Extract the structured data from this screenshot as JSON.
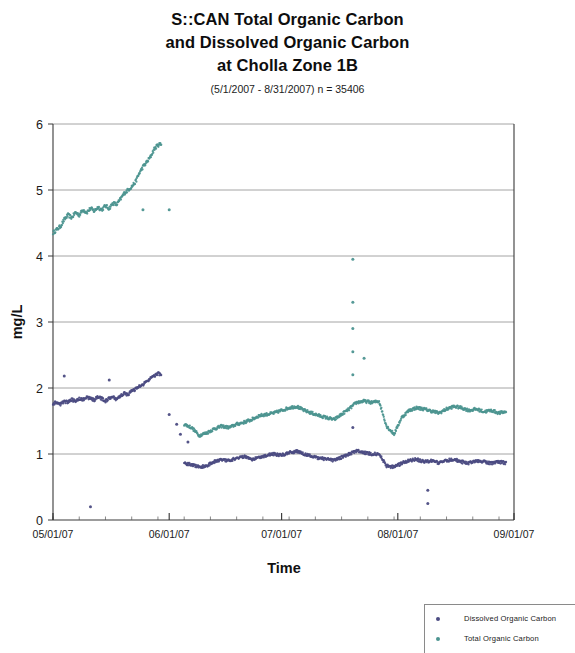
{
  "title": {
    "line1": "S::CAN Total Organic Carbon",
    "line2": "and Dissolved Organic Carbon",
    "line3": "at Cholla Zone 1B",
    "subtitle": "(5/1/2007 - 8/31/2007) n = 35406"
  },
  "legend": {
    "items": [
      {
        "label": "Dissolved Organic Carbon",
        "color": "#4b4b82"
      },
      {
        "label": "Total Organic Carbon",
        "color": "#4c9490"
      }
    ]
  },
  "chart_data": {
    "type": "scatter",
    "title": "S::CAN Total Organic Carbon and Dissolved Organic Carbon at Cholla Zone 1B",
    "subtitle": "(5/1/2007 - 8/31/2007) n = 35406",
    "xlabel": "Time",
    "ylabel": "mg/L",
    "xlim": [
      "05/01/07",
      "09/01/07"
    ],
    "ylim": [
      0,
      6
    ],
    "yticks": [
      0,
      1,
      2,
      3,
      4,
      5,
      6
    ],
    "xticks": [
      "05/01/07",
      "06/01/07",
      "07/01/07",
      "08/01/07",
      "09/01/07"
    ],
    "xtick_minor_interval_days": 7,
    "grid": "horizontal",
    "legend_position": "bottom-right",
    "n_points": 35406,
    "series": [
      {
        "name": "Total Organic Carbon",
        "color": "#4c9490",
        "x": [
          "05/01",
          "05/02",
          "05/03",
          "05/04",
          "05/05",
          "05/06",
          "05/07",
          "05/08",
          "05/09",
          "05/10",
          "05/11",
          "05/12",
          "05/13",
          "05/14",
          "05/15",
          "05/16",
          "05/17",
          "05/18",
          "05/19",
          "05/20",
          "05/21",
          "05/22",
          "05/23",
          "05/24",
          "05/25",
          "05/26",
          "05/27",
          "05/28",
          "05/29",
          "05/30",
          "06/05",
          "06/07",
          "06/09",
          "06/11",
          "06/13",
          "06/15",
          "06/17",
          "06/19",
          "06/21",
          "06/23",
          "06/25",
          "06/27",
          "06/29",
          "07/01",
          "07/03",
          "07/05",
          "07/07",
          "07/09",
          "07/11",
          "07/13",
          "07/15",
          "07/17",
          "07/19",
          "07/21",
          "07/23",
          "07/25",
          "07/27",
          "07/29",
          "07/31",
          "08/02",
          "08/04",
          "08/06",
          "08/08",
          "08/10",
          "08/12",
          "08/14",
          "08/16",
          "08/18",
          "08/20",
          "08/22",
          "08/24",
          "08/26",
          "08/28",
          "08/30"
        ],
        "values": [
          4.35,
          4.4,
          4.45,
          4.55,
          4.62,
          4.58,
          4.66,
          4.62,
          4.7,
          4.66,
          4.72,
          4.68,
          4.74,
          4.7,
          4.76,
          4.72,
          4.8,
          4.78,
          4.86,
          4.95,
          5.0,
          5.05,
          5.12,
          5.25,
          5.35,
          5.42,
          5.5,
          5.62,
          5.68,
          5.7,
          1.45,
          1.4,
          1.28,
          1.32,
          1.38,
          1.42,
          1.4,
          1.45,
          1.48,
          1.52,
          1.58,
          1.6,
          1.62,
          1.66,
          1.7,
          1.72,
          1.66,
          1.62,
          1.58,
          1.55,
          1.52,
          1.6,
          1.68,
          1.78,
          1.8,
          1.78,
          1.8,
          1.42,
          1.3,
          1.55,
          1.66,
          1.7,
          1.68,
          1.65,
          1.62,
          1.68,
          1.72,
          1.7,
          1.66,
          1.68,
          1.64,
          1.66,
          1.62,
          1.64
        ],
        "outliers": [
          {
            "x": "05/25",
            "y": 4.7
          },
          {
            "x": "06/01",
            "y": 4.7
          },
          {
            "x": "07/20",
            "y": 3.95
          },
          {
            "x": "07/20",
            "y": 3.3
          },
          {
            "x": "07/20",
            "y": 2.9
          },
          {
            "x": "07/20",
            "y": 2.55
          },
          {
            "x": "07/23",
            "y": 2.45
          },
          {
            "x": "07/20",
            "y": 2.2
          }
        ]
      },
      {
        "name": "Dissolved Organic Carbon",
        "color": "#4b4b82",
        "x": [
          "05/01",
          "05/02",
          "05/03",
          "05/04",
          "05/05",
          "05/06",
          "05/07",
          "05/08",
          "05/09",
          "05/10",
          "05/11",
          "05/12",
          "05/13",
          "05/14",
          "05/15",
          "05/16",
          "05/17",
          "05/18",
          "05/19",
          "05/20",
          "05/21",
          "05/22",
          "05/23",
          "05/24",
          "05/25",
          "05/26",
          "05/27",
          "05/28",
          "05/29",
          "05/30",
          "06/05",
          "06/07",
          "06/09",
          "06/11",
          "06/13",
          "06/15",
          "06/17",
          "06/19",
          "06/21",
          "06/23",
          "06/25",
          "06/27",
          "06/29",
          "07/01",
          "07/03",
          "07/05",
          "07/07",
          "07/09",
          "07/11",
          "07/13",
          "07/15",
          "07/17",
          "07/19",
          "07/21",
          "07/23",
          "07/25",
          "07/27",
          "07/29",
          "07/31",
          "08/02",
          "08/04",
          "08/06",
          "08/08",
          "08/10",
          "08/12",
          "08/14",
          "08/16",
          "08/18",
          "08/20",
          "08/22",
          "08/24",
          "08/26",
          "08/28",
          "08/30"
        ],
        "values": [
          1.76,
          1.78,
          1.75,
          1.8,
          1.78,
          1.82,
          1.8,
          1.84,
          1.82,
          1.86,
          1.84,
          1.82,
          1.86,
          1.84,
          1.8,
          1.84,
          1.86,
          1.82,
          1.88,
          1.92,
          1.9,
          1.95,
          1.98,
          2.02,
          2.05,
          2.1,
          2.14,
          2.18,
          2.22,
          2.2,
          0.86,
          0.84,
          0.8,
          0.82,
          0.88,
          0.92,
          0.9,
          0.94,
          0.96,
          0.92,
          0.95,
          0.98,
          1.0,
          0.98,
          1.02,
          1.04,
          1.0,
          0.96,
          0.94,
          0.92,
          0.9,
          0.95,
          1.0,
          1.05,
          1.02,
          1.0,
          1.0,
          0.82,
          0.8,
          0.86,
          0.9,
          0.92,
          0.88,
          0.9,
          0.86,
          0.9,
          0.92,
          0.88,
          0.86,
          0.9,
          0.88,
          0.86,
          0.88,
          0.86
        ],
        "outliers": [
          {
            "x": "05/04",
            "y": 2.18
          },
          {
            "x": "05/16",
            "y": 2.12
          },
          {
            "x": "06/01",
            "y": 1.6
          },
          {
            "x": "06/03",
            "y": 1.45
          },
          {
            "x": "06/04",
            "y": 1.3
          },
          {
            "x": "06/06",
            "y": 1.18
          },
          {
            "x": "07/20",
            "y": 1.4
          },
          {
            "x": "05/11",
            "y": 0.2
          },
          {
            "x": "08/09",
            "y": 0.45
          },
          {
            "x": "08/09",
            "y": 0.25
          }
        ]
      }
    ]
  },
  "icons": {
    "legend_marker": "dot-marker"
  }
}
